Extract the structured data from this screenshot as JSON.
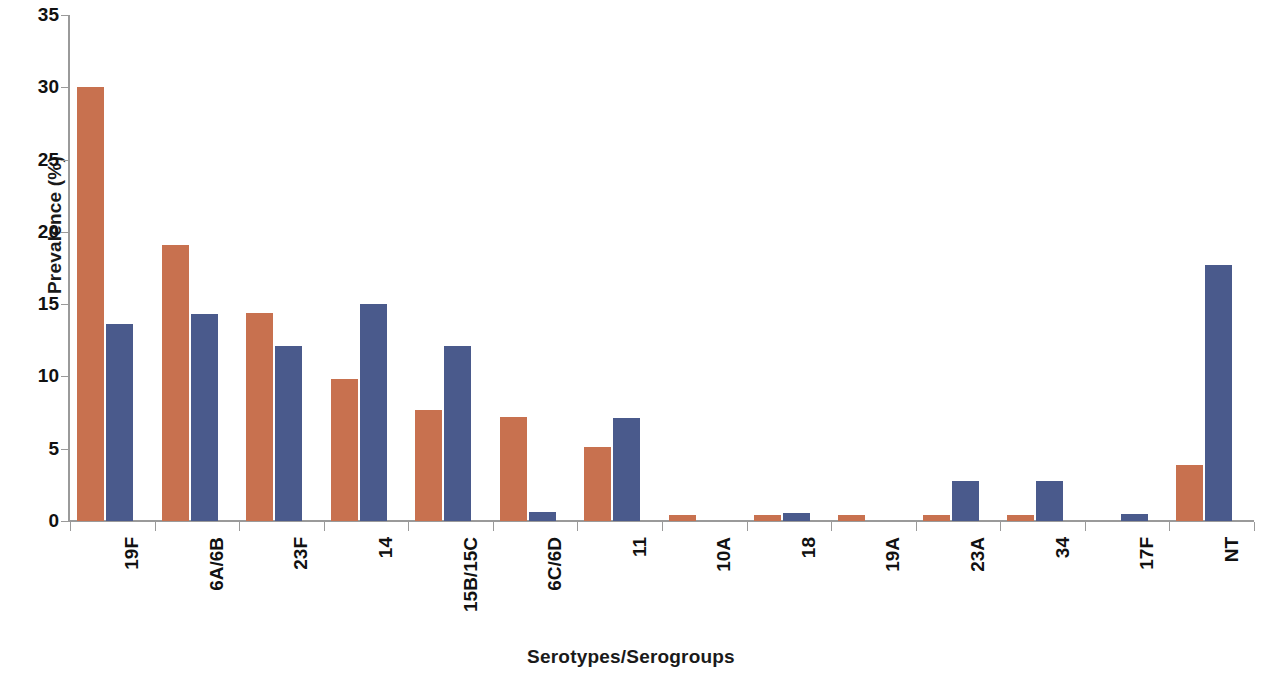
{
  "chart_data": {
    "type": "bar",
    "title": "",
    "xlabel": "Serotypes/Serogroups",
    "ylabel": "Prevalence (%)",
    "ylim": [
      0,
      35
    ],
    "y_ticks": [
      0,
      5,
      10,
      15,
      20,
      25,
      30,
      35
    ],
    "grid": false,
    "legend": "none",
    "categories": [
      "19F",
      "6A/6B",
      "23F",
      "14",
      "15B/15C",
      "6C/6D",
      "11",
      "10A",
      "18",
      "19A",
      "23A",
      "34",
      "17F",
      "NT"
    ],
    "series": [
      {
        "name": "series-a",
        "color": "#c8714f",
        "values": [
          30.0,
          19.1,
          14.4,
          9.8,
          7.7,
          7.2,
          5.1,
          0.4,
          0.4,
          0.4,
          0.4,
          0.4,
          0.0,
          3.9
        ]
      },
      {
        "name": "series-b",
        "color": "#4a5a8c",
        "values": [
          13.6,
          14.3,
          12.1,
          15.0,
          12.1,
          0.6,
          7.1,
          0.0,
          0.55,
          0.0,
          2.8,
          2.8,
          0.5,
          17.7
        ]
      }
    ]
  }
}
